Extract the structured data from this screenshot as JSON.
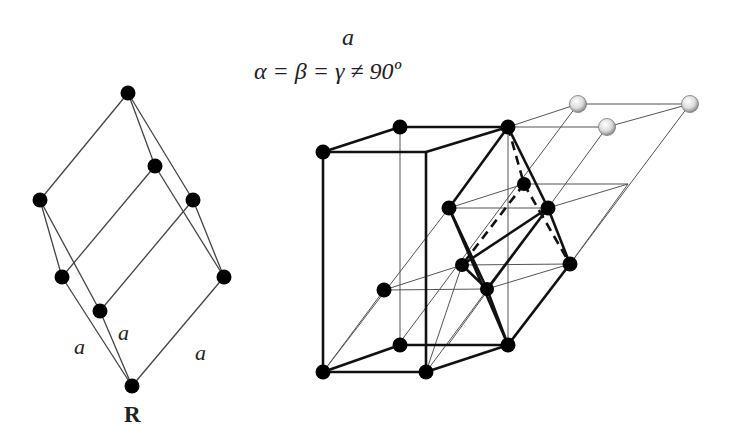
{
  "header": {
    "lattice_param": "a",
    "angle_relation": "α = β = γ ≠ 90º"
  },
  "left_diagram": {
    "name": "rhombohedral primitive cell",
    "edge_labels": [
      "a",
      "a",
      "a"
    ],
    "caption": "R"
  },
  "right_diagram": {
    "name": "rhombohedral cell in hexagonal setting"
  },
  "colors": {
    "atom": "#000000",
    "line": "#333333",
    "ghost_atom": "#d8d8d8"
  }
}
